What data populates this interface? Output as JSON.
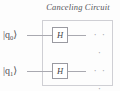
{
  "figure": {
    "title": "Canceling Circuit",
    "kind": "quantum-circuit-diagram",
    "colors": {
      "background": "#fdfdfd",
      "box_border": "#cfcfd4",
      "wire": "#a9a9b0",
      "gate_border": "#9a9aa1",
      "text": "#4d4d52",
      "title_text": "#55555a",
      "ellipsis": "#a4a4ab"
    }
  },
  "circuit": {
    "enclosure_label": "Canceling Circuit",
    "qubits": [
      {
        "label_bar": "|",
        "label_name": "q",
        "label_index": "0",
        "label_ket": "⟩",
        "label_full": "|q0⟩",
        "gates": [
          {
            "symbol": "H",
            "name": "hadamard-gate"
          }
        ],
        "continuation": "· · ·"
      },
      {
        "label_bar": "|",
        "label_name": "q",
        "label_index": "1",
        "label_ket": "⟩",
        "label_full": "|q1⟩",
        "gates": [
          {
            "symbol": "H",
            "name": "hadamard-gate"
          }
        ],
        "continuation": "· · ·"
      }
    ]
  }
}
